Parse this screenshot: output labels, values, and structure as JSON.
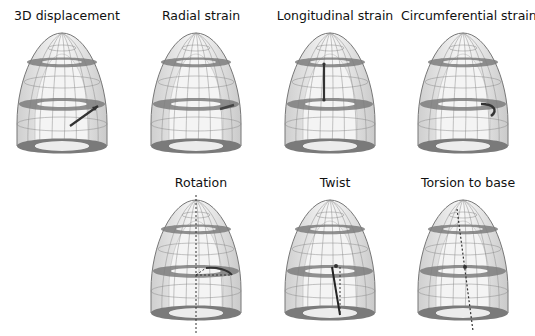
{
  "panels": [
    {
      "id": "3d-displacement",
      "title": "3D displacement",
      "x": 0,
      "y": 8,
      "marker": "arrow"
    },
    {
      "id": "radial-strain",
      "title": "Radial strain",
      "x": 134,
      "y": 8,
      "marker": "radial"
    },
    {
      "id": "longitudinal-strain",
      "title": "Longitudinal strain",
      "x": 268,
      "y": 8,
      "marker": "longitudinal"
    },
    {
      "id": "circumferential-strain",
      "title": "Circumferential strain",
      "x": 401,
      "y": 8,
      "marker": "circumferential"
    },
    {
      "id": "rotation",
      "title": "Rotation",
      "x": 134,
      "y": 175,
      "marker": "rotation"
    },
    {
      "id": "twist",
      "title": "Twist",
      "x": 268,
      "y": 175,
      "marker": "twist"
    },
    {
      "id": "torsion-to-base",
      "title": "Torsion to base",
      "x": 401,
      "y": 175,
      "marker": "torsion"
    }
  ],
  "colors": {
    "band": "#7d7d7d",
    "outline": "#6a6a6a",
    "fill": "#e6e6e6",
    "marker": "#333333"
  }
}
